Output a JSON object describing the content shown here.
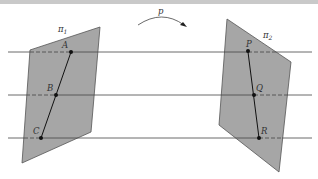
{
  "diagram": {
    "type": "projective-correspondence",
    "colors": {
      "plane_fill": "#a6a6a6",
      "plane_stroke": "#555555",
      "line": "#444444",
      "point": "#111111",
      "label": "#333333",
      "top_bar": "#c9c9c9"
    },
    "mapping_label": "p",
    "planes": [
      {
        "name": "π",
        "subscript": "1",
        "points": [
          {
            "label": "A"
          },
          {
            "label": "B"
          },
          {
            "label": "C"
          }
        ]
      },
      {
        "name": "π",
        "subscript": "2",
        "points": [
          {
            "label": "P"
          },
          {
            "label": "Q"
          },
          {
            "label": "R"
          }
        ]
      }
    ],
    "lines": [
      "A–P",
      "B–Q",
      "C–R"
    ]
  }
}
